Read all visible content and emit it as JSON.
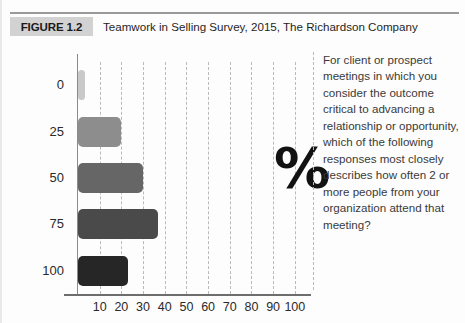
{
  "header": {
    "figure_tag": "FIGURE 1.2",
    "title": "Teamwork in Selling Survey, 2015, The Richardson Company"
  },
  "question": {
    "text": "For client or prospect meetings in which you consider the outcome critical to advancing a relationship or opportunity, which of the following responses most closely describes how often 2 or more people from your organization attend that meeting?"
  },
  "glyph": {
    "percent": "%"
  },
  "colors": {
    "bar_0": "#c9c9c9",
    "bar_25": "#8d8d8d",
    "bar_50": "#666666",
    "bar_75": "#4a4a4a",
    "bar_100": "#262626",
    "grid": "#b9b9b9",
    "axis": "#6d6d6d",
    "tag_background": "#d2d2d2"
  },
  "chart_data": {
    "type": "bar",
    "orientation": "horizontal",
    "title": "Teamwork in Selling Survey, 2015, The Richardson Company",
    "xlabel": "",
    "ylabel": "",
    "categories": [
      "0",
      "25",
      "50",
      "75",
      "100"
    ],
    "values": [
      3,
      20,
      30,
      37,
      23
    ],
    "xticks": [
      10,
      20,
      30,
      40,
      50,
      60,
      70,
      80,
      90,
      100
    ],
    "xlim": [
      0,
      107
    ],
    "grid": true,
    "grid_style": "dashed-vertical",
    "legend": "none",
    "annotation": "%",
    "bar_colors": [
      "#c9c9c9",
      "#8d8d8d",
      "#666666",
      "#4a4a4a",
      "#262626"
    ]
  }
}
